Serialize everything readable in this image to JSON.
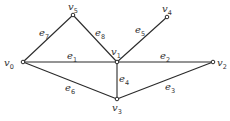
{
  "diagram": {
    "type": "graph",
    "nodes": [
      {
        "id": "v0",
        "letter": "v",
        "sub": "0",
        "x": 23,
        "y": 62,
        "lx": 4,
        "ly": 66
      },
      {
        "id": "v1",
        "letter": "v",
        "sub": "1",
        "x": 117,
        "y": 62,
        "lx": 111,
        "ly": 55
      },
      {
        "id": "v2",
        "letter": "v",
        "sub": "2",
        "x": 213,
        "y": 62,
        "lx": 217,
        "ly": 66
      },
      {
        "id": "v3",
        "letter": "v",
        "sub": "3",
        "x": 117,
        "y": 99,
        "lx": 112,
        "ly": 111
      },
      {
        "id": "v4",
        "letter": "v",
        "sub": "4",
        "x": 167,
        "y": 17,
        "lx": 162,
        "ly": 12
      },
      {
        "id": "v5",
        "letter": "v",
        "sub": "5",
        "x": 73,
        "y": 15,
        "lx": 68,
        "ly": 10
      }
    ],
    "edges": [
      {
        "id": "e1",
        "from": "v0",
        "to": "v1",
        "letter": "e",
        "sub": "1",
        "lx": 67,
        "ly": 59
      },
      {
        "id": "e2",
        "from": "v1",
        "to": "v2",
        "letter": "e",
        "sub": "2",
        "lx": 160,
        "ly": 59
      },
      {
        "id": "e3",
        "from": "v3",
        "to": "v2",
        "letter": "e",
        "sub": "3",
        "lx": 165,
        "ly": 90
      },
      {
        "id": "e4",
        "from": "v1",
        "to": "v3",
        "letter": "e",
        "sub": "4",
        "lx": 119,
        "ly": 82
      },
      {
        "id": "e5",
        "from": "v1",
        "to": "v4",
        "letter": "e",
        "sub": "5",
        "lx": 135,
        "ly": 33
      },
      {
        "id": "e6",
        "from": "v0",
        "to": "v3",
        "letter": "e",
        "sub": "6",
        "lx": 65,
        "ly": 91
      },
      {
        "id": "e7",
        "from": "v0",
        "to": "v5",
        "letter": "e",
        "sub": "7",
        "lx": 39,
        "ly": 36
      },
      {
        "id": "e8",
        "from": "v5",
        "to": "v1",
        "letter": "e",
        "sub": "8",
        "lx": 95,
        "ly": 36
      }
    ]
  }
}
